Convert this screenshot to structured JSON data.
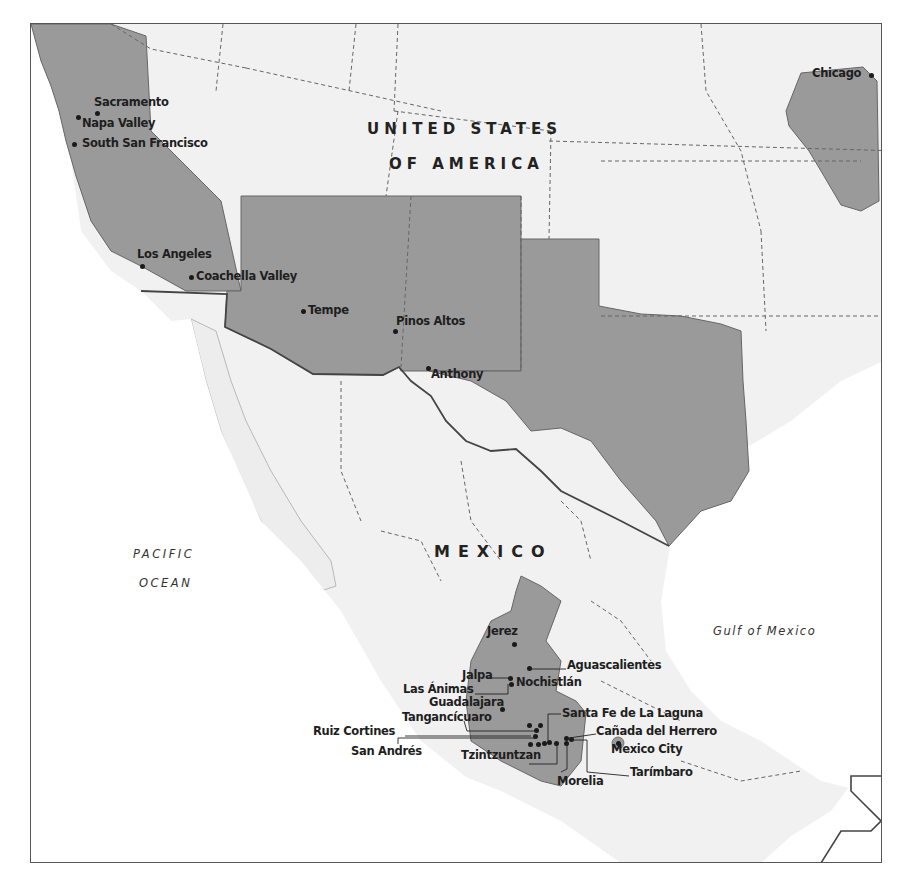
{
  "countries": {
    "usa_line1": "UNITED STATES",
    "usa_line2": "OF AMERICA",
    "mexico": "MEXICO"
  },
  "water_bodies": {
    "pacific_line1": "PACIFIC",
    "pacific_line2": "OCEAN",
    "gulf": "Gulf of Mexico"
  },
  "colors": {
    "highlight_fill": "#9a9a9a",
    "land_fill": "#f1f1f1",
    "ocean_fill": "#ffffff",
    "border_line": "#555555",
    "label_text": "#1e1e1e"
  },
  "places": [
    {
      "name": "Sacramento"
    },
    {
      "name": "Napa Valley"
    },
    {
      "name": "South San Francisco"
    },
    {
      "name": "Los Angeles"
    },
    {
      "name": "Coachella Valley"
    },
    {
      "name": "Tempe"
    },
    {
      "name": "Pinos Altos"
    },
    {
      "name": "Anthony"
    },
    {
      "name": "Chicago"
    },
    {
      "name": "Jerez"
    },
    {
      "name": "Aguascalientes"
    },
    {
      "name": "Jalpa"
    },
    {
      "name": "Nochistlán"
    },
    {
      "name": "Las Ánimas"
    },
    {
      "name": "Guadalajara"
    },
    {
      "name": "Santa Fe de La Laguna"
    },
    {
      "name": "Tangancícuaro"
    },
    {
      "name": "Cañada del Herrero"
    },
    {
      "name": "Ruiz Cortines"
    },
    {
      "name": "Mexico City"
    },
    {
      "name": "San Andrés"
    },
    {
      "name": "Tzintzuntzan"
    },
    {
      "name": "Tarímbaro"
    },
    {
      "name": "Morelia"
    }
  ]
}
